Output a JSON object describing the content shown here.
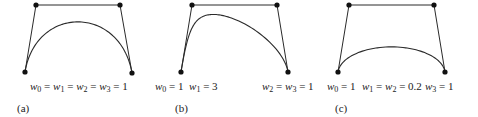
{
  "figure": {
    "panels": [
      {
        "id": "a",
        "caption": "(a)",
        "control_points": [
          [
            25,
            72
          ],
          [
            36,
            5
          ],
          [
            120,
            5
          ],
          [
            132,
            73
          ]
        ],
        "weights": [
          1,
          1,
          1,
          1
        ],
        "labels": [
          {
            "text": "w0 = w1 = w2 = w3 = 1",
            "html": "<i>w</i><sub>0</sub> = <i>w</i><sub>1</sub> = <i>w</i><sub>2</sub> = <i>w</i><sub>3</sub> = 1",
            "x": 30,
            "y": 81
          }
        ],
        "caption_pos": {
          "x": 17,
          "y": 103
        }
      },
      {
        "id": "b",
        "caption": "(b)",
        "control_points": [
          [
            181,
            72
          ],
          [
            192,
            5
          ],
          [
            277,
            5
          ],
          [
            288,
            72
          ]
        ],
        "weights": [
          1,
          3,
          1,
          1
        ],
        "labels": [
          {
            "text": "w0 = 1  w1 = 3",
            "html": "<i>w</i><sub>0</sub> = 1&nbsp;&nbsp;<i>w</i><sub>1</sub> = 3",
            "x": 155,
            "y": 81
          },
          {
            "text": "w2 = w3 = 1",
            "html": "<i>w</i><sub>2</sub> = <i>w</i><sub>3</sub> = 1",
            "x": 262,
            "y": 81
          }
        ],
        "caption_pos": {
          "x": 175,
          "y": 103
        }
      },
      {
        "id": "c",
        "caption": "(c)",
        "control_points": [
          [
            338,
            72
          ],
          [
            349,
            5
          ],
          [
            434,
            5
          ],
          [
            445,
            72
          ]
        ],
        "weights": [
          1,
          0.2,
          0.2,
          1
        ],
        "labels": [
          {
            "text": "w0 = 1",
            "html": "<i>w</i><sub>0</sub> = 1",
            "x": 327,
            "y": 81
          },
          {
            "text": "w1 = w2 = 0.2",
            "html": "<i>w</i><sub>1</sub> = <i>w</i><sub>2</sub> = 0.2",
            "x": 362,
            "y": 81
          },
          {
            "text": "w3 = 1",
            "html": "<i>w</i><sub>3</sub> = 1",
            "x": 425,
            "y": 81
          }
        ],
        "caption_pos": {
          "x": 335,
          "y": 103
        }
      }
    ],
    "colors": {
      "stroke": "#2a2a2a",
      "point": "#111111",
      "text": "#222222"
    }
  }
}
